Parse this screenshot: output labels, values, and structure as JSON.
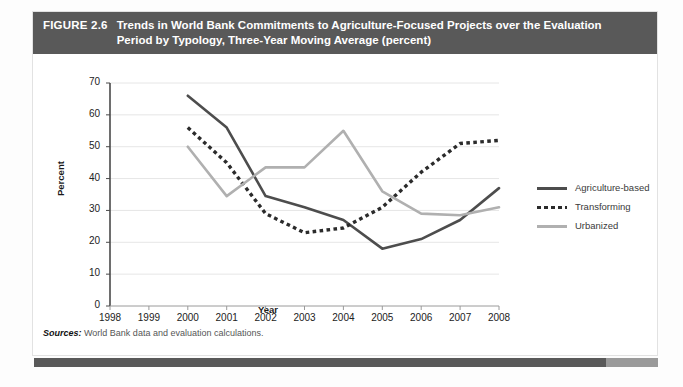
{
  "figure": {
    "number": "FIGURE 2.6",
    "title": "Trends in World Bank Commitments to Agriculture-Focused Projects over the Evaluation Period by Typology, Three-Year Moving Average (percent)",
    "sources_label": "Sources:",
    "sources_text": " World Bank data and evaluation calculations."
  },
  "colors": {
    "header_bar": "#595959",
    "bottom_bar": "#595959",
    "bottom_bar_tail": "#9a9a9a",
    "agriculture_based": "#4d4d4d",
    "transforming": "#2b2b2b",
    "urbanized": "#b0b0b0",
    "gridline": "#e6e6e6",
    "axis": "#555555"
  },
  "chart_data": {
    "type": "line",
    "title": "Trends in World Bank Commitments to Agriculture-Focused Projects over the Evaluation Period by Typology, Three-Year Moving Average (percent)",
    "xlabel": "Year",
    "ylabel": "Percent",
    "x": [
      1998,
      1999,
      2000,
      2001,
      2002,
      2003,
      2004,
      2005,
      2006,
      2007,
      2008
    ],
    "xtick_labels": [
      "1998",
      "1999",
      "2000",
      "2001",
      "2002",
      "2003",
      "2004",
      "2005",
      "2006",
      "2007",
      "2008"
    ],
    "ytick_labels": [
      "0",
      "10",
      "20",
      "30",
      "40",
      "50",
      "60",
      "70"
    ],
    "yticks": [
      0,
      10,
      20,
      30,
      40,
      50,
      60,
      70
    ],
    "ylim": [
      0,
      70
    ],
    "xlim": [
      1998,
      2008
    ],
    "grid": true,
    "legend_position": "right",
    "series": [
      {
        "name": "Agriculture-based",
        "style": "solid",
        "color": "#4d4d4d",
        "x": [
          2000,
          2001,
          2002,
          2003,
          2004,
          2005,
          2006,
          2007,
          2008
        ],
        "values": [
          66,
          56,
          34.5,
          31,
          27,
          18,
          21,
          27,
          37
        ]
      },
      {
        "name": "Transforming",
        "style": "dotted",
        "color": "#2b2b2b",
        "x": [
          2000,
          2001,
          2002,
          2003,
          2004,
          2005,
          2006,
          2007,
          2008
        ],
        "values": [
          56,
          45,
          29,
          23,
          24.5,
          31,
          42,
          51,
          52
        ]
      },
      {
        "name": "Urbanized",
        "style": "solid",
        "color": "#b0b0b0",
        "x": [
          2000,
          2001,
          2002,
          2003,
          2004,
          2005,
          2006,
          2007,
          2008
        ],
        "values": [
          50,
          34.5,
          43.5,
          43.5,
          55,
          36,
          29,
          28.5,
          31
        ]
      }
    ]
  },
  "legend": {
    "items": [
      {
        "label": "Agriculture-based"
      },
      {
        "label": "Transforming"
      },
      {
        "label": "Urbanized"
      }
    ]
  }
}
